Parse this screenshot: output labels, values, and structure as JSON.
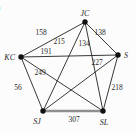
{
  "figure": {
    "list_marker": ")",
    "colors": {
      "edge": "#222222",
      "thick_edge": "#8f8f8f",
      "node_dot": "#111111",
      "label_text": "#2b2b2b",
      "background": "#fcfcfc"
    },
    "graph": {
      "nodes": [
        {
          "id": "JC",
          "label": "JC",
          "x": 85,
          "y": 22,
          "lx": 85,
          "ly": 16,
          "anchor": "middle"
        },
        {
          "id": "KC",
          "label": "KC",
          "x": 21,
          "y": 57,
          "lx": 15,
          "ly": 60,
          "anchor": "end"
        },
        {
          "id": "S",
          "label": "S",
          "x": 118,
          "y": 55,
          "lx": 124,
          "ly": 58,
          "anchor": "start"
        },
        {
          "id": "SJ",
          "label": "SJ",
          "x": 43,
          "y": 111,
          "lx": 37,
          "ly": 124,
          "anchor": "middle"
        },
        {
          "id": "SL",
          "label": "SL",
          "x": 103,
          "y": 111,
          "lx": 104,
          "ly": 125,
          "anchor": "middle"
        }
      ],
      "edges": [
        {
          "from": "JC",
          "to": "KC",
          "weight": "158",
          "wx": 41,
          "wy": 35,
          "thick": false
        },
        {
          "from": "JC",
          "to": "SJ",
          "weight": "215",
          "wx": 59,
          "wy": 44,
          "thick": false
        },
        {
          "from": "KC",
          "to": "S",
          "weight": "191",
          "wx": 46,
          "wy": 54,
          "thick": false
        },
        {
          "from": "JC",
          "to": "S",
          "weight": "138",
          "wx": 100,
          "wy": 35,
          "thick": false
        },
        {
          "from": "JC",
          "to": "SL",
          "weight": "134",
          "wx": 84,
          "wy": 46,
          "thick": false
        },
        {
          "from": "S",
          "to": "SJ",
          "weight": "227",
          "wx": 97,
          "wy": 65,
          "thick": false
        },
        {
          "from": "KC",
          "to": "SL",
          "weight": "249",
          "wx": 40,
          "wy": 75,
          "thick": false
        },
        {
          "from": "KC",
          "to": "SJ",
          "weight": "56",
          "wx": 18,
          "wy": 90,
          "thick": false
        },
        {
          "from": "S",
          "to": "SL",
          "weight": "218",
          "wx": 117,
          "wy": 90,
          "thick": false
        },
        {
          "from": "SJ",
          "to": "SL",
          "weight": "307",
          "wx": 74,
          "wy": 122,
          "thick": true
        }
      ]
    }
  }
}
